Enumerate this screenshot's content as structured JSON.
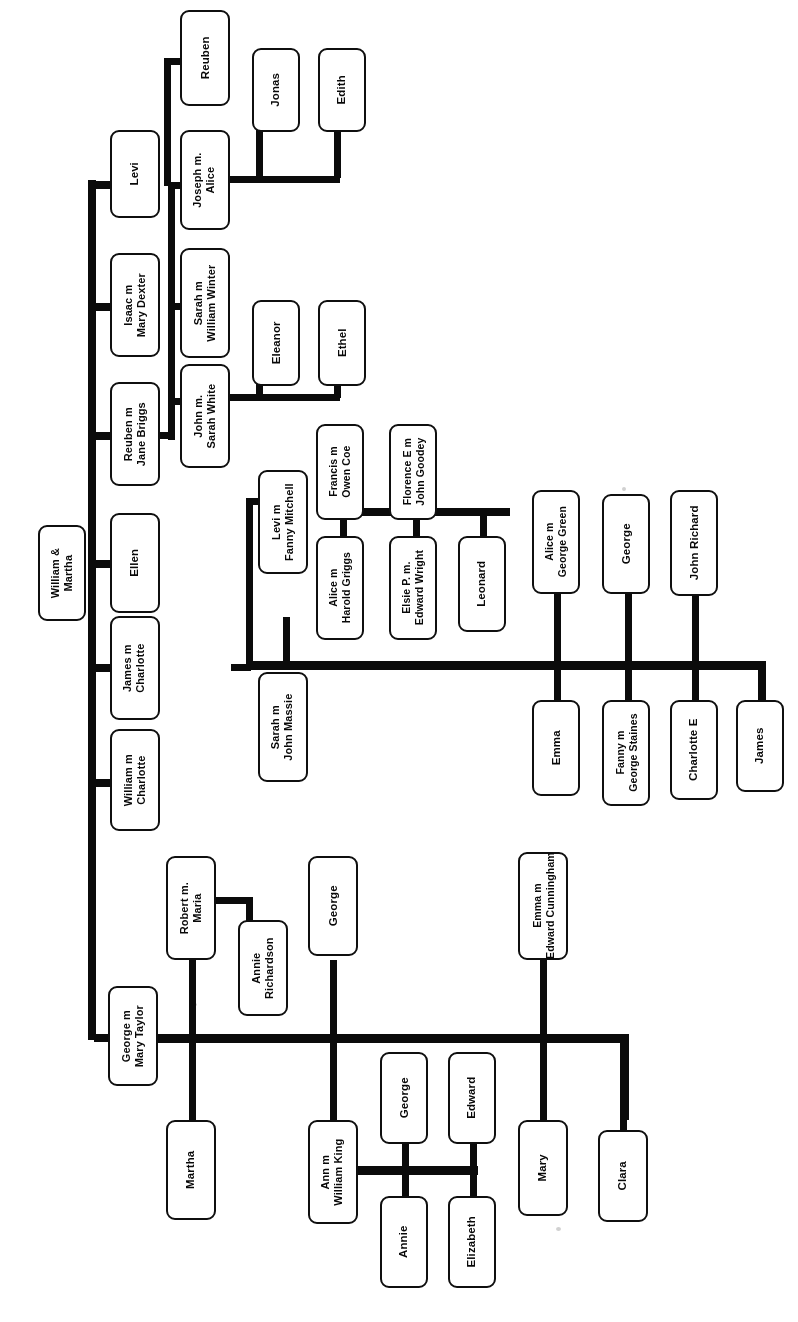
{
  "chart": {
    "type": "genealogy-tree",
    "orientation": "rotated-90-ccw",
    "line_color": "#111111",
    "box_border_color": "#111111",
    "box_fill_color": "#ffffff",
    "background_color": "#ffffff"
  },
  "nodes": {
    "root": "William &\nMartha",
    "george_mary_taylor": "George m\nMary Taylor",
    "william_charlotte": "William m\nCharlotte",
    "james_charlotte": "James m\nCharlotte",
    "ellen": "Ellen",
    "reuben_jane_briggs": "Reuben m\nJane Briggs",
    "isaac_mary_dexter": "Isaac m\nMary Dexter",
    "levi": "Levi",
    "joseph_alice": "Joseph m.\nAlice",
    "reuben": "Reuben",
    "jonas": "Jonas",
    "edith": "Edith",
    "sarah_william_winter": "Sarah m\nWilliam Winter",
    "john_sarah_white": "John m.\nSarah White",
    "eleanor": "Eleanor",
    "ethel": "Ethel",
    "levi_fanny_mitchell": "Levi m\nFanny Mitchell",
    "francis_owen_coe": "Francis m\nOwen Coe",
    "florence_john_goodey": "Florence E m\nJohn Goodey",
    "alice_harold_griggs": "Alice m\nHarold Griggs",
    "elsie_edward_wright": "Elsie P. m.\nEdward Wright",
    "leonard": "Leonard",
    "sarah_john_massie": "Sarah m\nJohn Massie",
    "alice_george_green": "Alice m\nGeorge Green",
    "george_massie": "George",
    "john_richard": "John Richard",
    "emma_massie": "Emma",
    "fanny_george_staines": "Fanny m\nGeorge Staines",
    "charlotte_e": "Charlotte E",
    "james_massie": "James",
    "robert_maria": "Robert m.\nMaria",
    "annie_richardson": "Annie\nRichardson",
    "martha": "Martha",
    "george_taylor_son": "George",
    "ann_william_king": "Ann m\nWilliam King",
    "king_george": "George",
    "king_annie": "Annie",
    "king_edward": "Edward",
    "king_elizabeth": "Elizabeth",
    "emma_edward_cunningham": "Emma m\nEdward Cunningham",
    "mary": "Mary",
    "clara": "Clara"
  }
}
